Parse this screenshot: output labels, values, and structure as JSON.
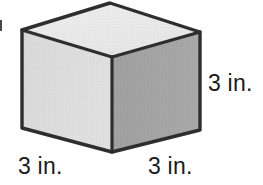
{
  "figure": {
    "shape_name": "cube",
    "projection": "isometric",
    "labels": {
      "height_right": "3 in.",
      "base_left": "3 in.",
      "base_right": "3 in."
    },
    "colors": {
      "top_face": "#e9e9e9",
      "left_face": "#dddddd",
      "right_face": "#a3a3a3",
      "edge_stroke": "#2e2e2e",
      "text": "#1a1a1a",
      "background": "#ffffff"
    },
    "geometry": {
      "top_apex": [
        110,
        3
      ],
      "top_left": [
        22,
        30
      ],
      "top_right": [
        200,
        32
      ],
      "front_top_center": [
        112,
        57
      ],
      "bottom_left": [
        22,
        128
      ],
      "bottom_right": [
        200,
        130
      ],
      "front_bottom_center": [
        112,
        152
      ]
    }
  }
}
